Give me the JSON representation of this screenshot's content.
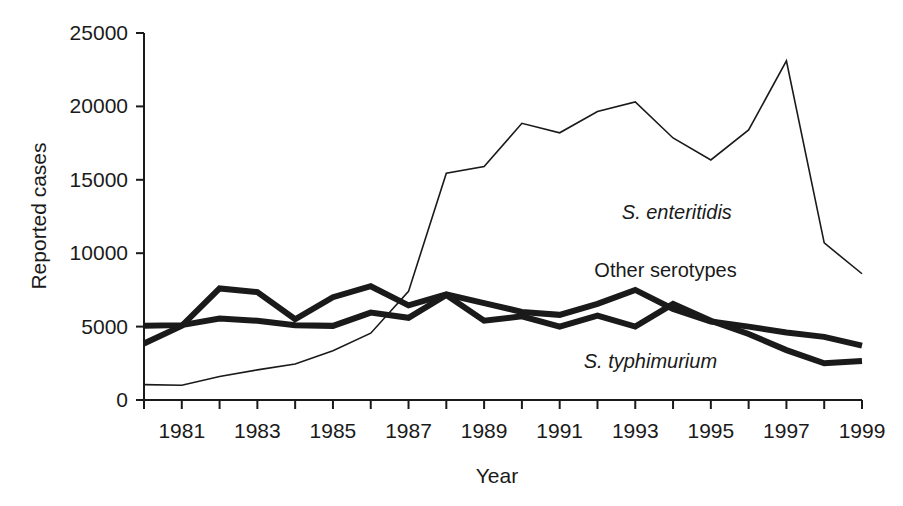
{
  "chart_data": {
    "type": "line",
    "title": "",
    "xlabel": "Year",
    "ylabel": "Reported cases",
    "xlim": [
      1980,
      1999
    ],
    "ylim": [
      0,
      25000
    ],
    "grid": false,
    "legend_position": "inline-annotations",
    "x": [
      1980,
      1981,
      1982,
      1983,
      1984,
      1985,
      1986,
      1987,
      1988,
      1989,
      1990,
      1991,
      1992,
      1993,
      1994,
      1995,
      1996,
      1997,
      1998,
      1999
    ],
    "x_tick_labels": [
      "1981",
      "1983",
      "1985",
      "1987",
      "1989",
      "1991",
      "1993",
      "1995",
      "1997",
      "1999"
    ],
    "x_tick_values": [
      1981,
      1983,
      1985,
      1987,
      1989,
      1991,
      1993,
      1995,
      1997,
      1999
    ],
    "y_tick_labels": [
      "0",
      "5000",
      "10000",
      "15000",
      "20000",
      "25000"
    ],
    "y_tick_values": [
      0,
      5000,
      10000,
      15000,
      20000,
      25000
    ],
    "series": [
      {
        "name": "S. enteritidis",
        "style": "thin",
        "stroke_width": 1.6,
        "color": "#1a1a1a",
        "label_x": 1994.1,
        "label_y": 12300,
        "values": [
          1050,
          1000,
          1600,
          2050,
          2450,
          3350,
          4550,
          7400,
          15450,
          15900,
          18850,
          18200,
          19650,
          20300,
          17850,
          16350,
          18400,
          23100,
          10700,
          8600
        ]
      },
      {
        "name": "Other serotypes",
        "style": "thick",
        "stroke_width": 6,
        "color": "#1a1a1a",
        "label_x": 1993.8,
        "label_y": 8350,
        "values": [
          3850,
          5050,
          7600,
          7350,
          5500,
          7000,
          7750,
          6450,
          7200,
          6600,
          6000,
          5800,
          6550,
          7500,
          6200,
          5350,
          5000,
          4600,
          4300,
          3700
        ]
      },
      {
        "name": "S. typhimurium",
        "style": "thick",
        "stroke_width": 6,
        "color": "#1a1a1a",
        "label_x": 1993.4,
        "label_y": 2200,
        "values": [
          5050,
          5100,
          5550,
          5400,
          5100,
          5050,
          5950,
          5600,
          7150,
          5400,
          5700,
          5000,
          5750,
          5000,
          6550,
          5400,
          4500,
          3400,
          2500,
          2650
        ]
      }
    ]
  },
  "axes": {
    "y_axis_title": "Reported cases",
    "x_axis_title": "Year"
  }
}
